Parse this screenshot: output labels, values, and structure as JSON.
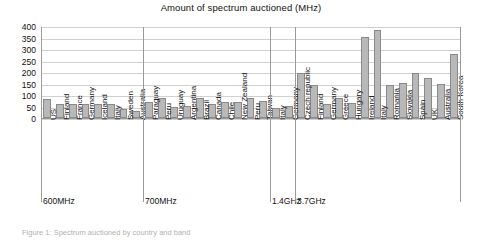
{
  "chart_data": {
    "type": "bar",
    "title": "Amount of spectrum auctioned (MHz)",
    "xlabel": "",
    "ylabel": "",
    "ylim": [
      0,
      400
    ],
    "ytick_step": 50,
    "yticks": [
      400,
      350,
      300,
      250,
      200,
      150,
      100,
      50,
      0
    ],
    "grid": true,
    "legend": "none",
    "categories": [
      "US",
      "Finland",
      "France",
      "Germany",
      "Iceland",
      "Italy",
      "Sweden",
      "Australia",
      "Paraguay",
      "Peru",
      "Uruguay",
      "Argentina",
      "Brazil",
      "Canada",
      "Chile",
      "New Zealand",
      "Peru",
      "Taiwan",
      "Italy",
      "Germany",
      "Czech republic",
      "Finland",
      "Germany",
      "Greece",
      "Hungary",
      "Ireland",
      "Italy",
      "Romania",
      "Slovakia",
      "Spain",
      "UK",
      "Australia",
      "South Korea"
    ],
    "values": [
      84,
      60,
      60,
      60,
      60,
      60,
      40,
      30,
      70,
      90,
      50,
      55,
      90,
      60,
      70,
      70,
      90,
      75,
      45,
      55,
      200,
      145,
      60,
      90,
      65,
      355,
      385,
      145,
      155,
      200,
      175,
      150,
      280
    ],
    "bands": [
      {
        "label": "600MHz",
        "from": 0,
        "to": 7
      },
      {
        "label": "700MHz",
        "from": 8,
        "to": 17
      },
      {
        "label": "1.4GHz",
        "from": 18,
        "to": 19
      },
      {
        "label": "3.7GHz",
        "from": 20,
        "to": 32
      }
    ],
    "bar_fill": "#b8b8b8",
    "bar_stroke": "#8a8a8a",
    "grid_color": "#d0d0d0",
    "axis_color": "#9a9a9a"
  },
  "caption": {
    "text": "Figure 1: Spectrum auctioned by country and band"
  }
}
